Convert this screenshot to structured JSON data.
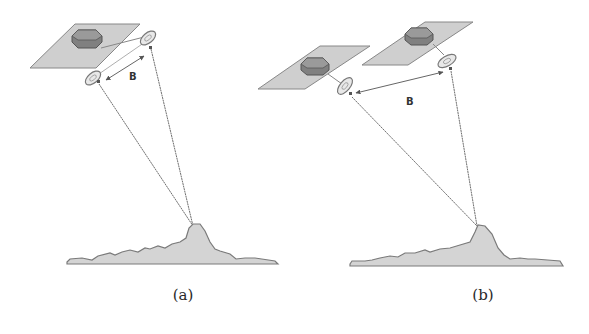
{
  "figure": {
    "panels": [
      {
        "id": "a",
        "caption": "(a)",
        "baseline_label": "B",
        "description": "Single satellite platform with two antennas separated by baseline B, both viewing the same terrain point"
      },
      {
        "id": "b",
        "caption": "(b)",
        "baseline_label": "B",
        "description": "Two separate satellite platforms, each with one antenna, separated by baseline B, both viewing the same terrain point"
      }
    ],
    "colors": {
      "panel_fill": "#c8c8c8",
      "body_fill": "#7a7a7a",
      "line": "#707070",
      "terrain_fill": "#d0d0d0",
      "terrain_edge": "#7a7a7a"
    }
  }
}
